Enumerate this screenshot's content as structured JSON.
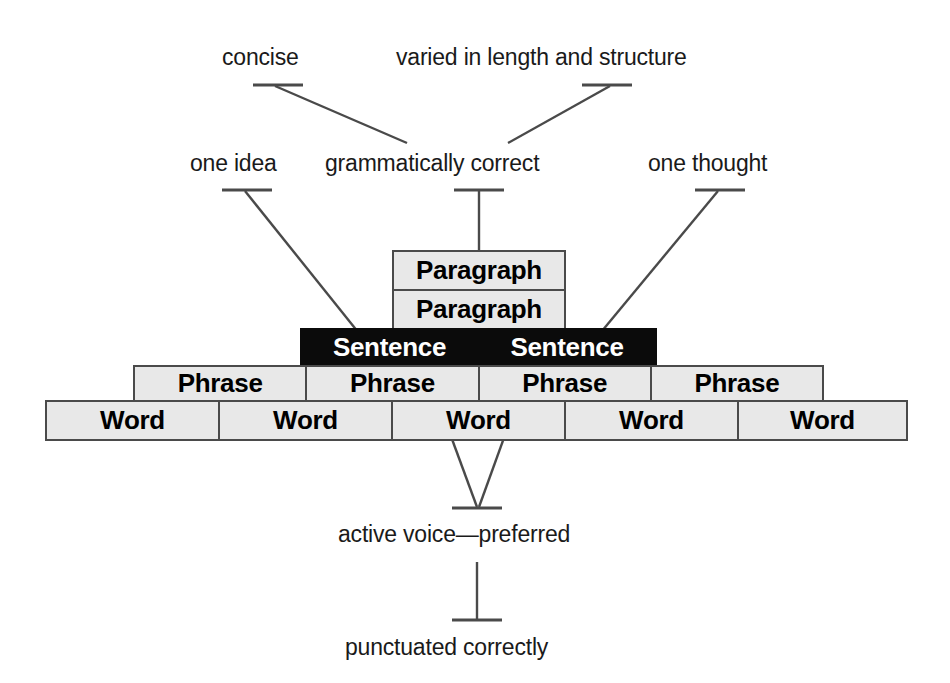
{
  "diagram": {
    "background_color": "#ffffff",
    "line_color": "#4a4a4a",
    "block_fill": "#e8e8e8",
    "block_border": "#4a4a4a",
    "highlight_fill": "#0b0b0b",
    "highlight_text": "#ffffff"
  },
  "annotations": {
    "concise": "concise",
    "varied": "varied in length and structure",
    "one_idea": "one idea",
    "grammatically_correct": "grammatically correct",
    "one_thought": "one thought",
    "active_voice": "active voice—preferred",
    "punctuated": "punctuated correctly"
  },
  "pyramid": {
    "levels": [
      {
        "name": "paragraph",
        "label": "Paragraph",
        "style": "light",
        "cells": [
          "Paragraph"
        ]
      },
      {
        "name": "paragraph-2",
        "label": "Paragraph",
        "style": "light",
        "cells": [
          "Paragraph"
        ]
      },
      {
        "name": "sentence",
        "label": "Sentence",
        "style": "dark",
        "cells": [
          "Sentence",
          "Sentence"
        ]
      },
      {
        "name": "phrase",
        "label": "Phrase",
        "style": "light",
        "cells": [
          "Phrase",
          "Phrase",
          "Phrase",
          "Phrase"
        ]
      },
      {
        "name": "word",
        "label": "Word",
        "style": "light",
        "cells": [
          "Word",
          "Word",
          "Word",
          "Word",
          "Word"
        ]
      }
    ]
  }
}
